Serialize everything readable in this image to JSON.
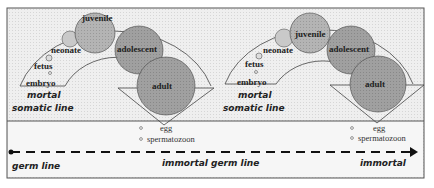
{
  "panels": [
    {
      "stages": [
        "embryo",
        "fetus",
        "neonate",
        "juvenile",
        "adolescent",
        "adult"
      ],
      "somatic_label_1": "mortal",
      "somatic_label_2": "somatic line",
      "gametes": [
        "egg",
        "spermatozoon"
      ]
    },
    {
      "stages": [
        "embryo",
        "fetus",
        "neonate",
        "juvenile",
        "adolescent",
        "adult"
      ],
      "somatic_label_1": "mortal",
      "somatic_label_2": "somatic line",
      "gametes": [
        "egg",
        "spermatozoon"
      ]
    }
  ],
  "germ_line": {
    "start_label": "germ line",
    "middle_label": "immortal germ line",
    "end_label": "immortal"
  },
  "colors": {
    "background": "#ececec",
    "circle_fill": "#9a9a9a",
    "circle_light": "#c8c8c8",
    "line": "#333333"
  }
}
